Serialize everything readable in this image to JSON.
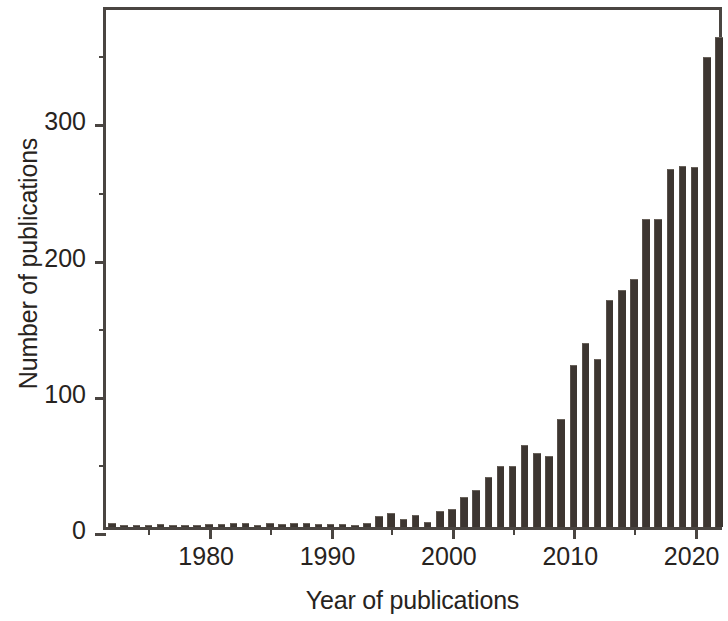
{
  "chart_data": {
    "type": "bar",
    "title": "",
    "subtitle": "",
    "xlabel": "Year of publications",
    "ylabel": "Number of publications",
    "xlim": [
      1971.5,
      2022.5
    ],
    "ylim": [
      0,
      384
    ],
    "grid": false,
    "legend": null,
    "bar_color": "#3d3631",
    "axis_color": "#4a4541",
    "background": "#ffffff",
    "y_ticks_major": [
      0,
      100,
      200,
      300
    ],
    "y_ticks_minor": [
      50,
      150,
      250,
      350
    ],
    "y_tick_labels": [
      "0",
      "100",
      "200",
      "300"
    ],
    "x_ticks_major": [
      1980,
      1990,
      2000,
      2010,
      2020
    ],
    "x_ticks_minor": [
      1975,
      1985,
      1995,
      2005,
      2015
    ],
    "x_tick_labels": [
      "1980",
      "1990",
      "2000",
      "2010",
      "2020"
    ],
    "categories": [
      1972,
      1973,
      1974,
      1975,
      1976,
      1977,
      1978,
      1979,
      1980,
      1981,
      1982,
      1983,
      1984,
      1985,
      1986,
      1987,
      1988,
      1989,
      1990,
      1991,
      1992,
      1993,
      1994,
      1995,
      1996,
      1997,
      1998,
      1999,
      2000,
      2001,
      2002,
      2003,
      2004,
      2005,
      2006,
      2007,
      2008,
      2009,
      2010,
      2011,
      2012,
      2013,
      2014,
      2015,
      2016,
      2017,
      2018,
      2019,
      2020,
      2021,
      2022
    ],
    "values": [
      3,
      0,
      0,
      0,
      2,
      0,
      0,
      1,
      2,
      2,
      3,
      3,
      1,
      3,
      2,
      3,
      3,
      2,
      2,
      2,
      1,
      3,
      8,
      10,
      6,
      9,
      4,
      12,
      13,
      22,
      27,
      37,
      45,
      45,
      60,
      54,
      52,
      79,
      119,
      135,
      123,
      167,
      174,
      182,
      226,
      226,
      263,
      265,
      264,
      345,
      360
    ]
  },
  "axes": {
    "y_title": "Number of publications",
    "x_title": "Year of publications"
  }
}
